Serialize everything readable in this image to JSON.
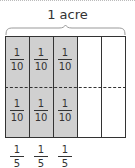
{
  "title": "1 acre",
  "grid": {
    "columns": 5,
    "rows": 2,
    "shaded_columns": 3,
    "colors": {
      "shaded": "#d0d0d0",
      "unshaded": "#ffffff",
      "lines": "#333333"
    }
  },
  "cell_labels": [
    {
      "numerator": "1",
      "denominator": "10"
    },
    {
      "numerator": "1",
      "denominator": "10"
    },
    {
      "numerator": "1",
      "denominator": "10"
    },
    {
      "numerator": "1",
      "denominator": "10"
    },
    {
      "numerator": "1",
      "denominator": "10"
    },
    {
      "numerator": "1",
      "denominator": "10"
    }
  ],
  "column_labels": [
    {
      "numerator": "1",
      "denominator": "5"
    },
    {
      "numerator": "1",
      "denominator": "5"
    },
    {
      "numerator": "1",
      "denominator": "5"
    }
  ]
}
